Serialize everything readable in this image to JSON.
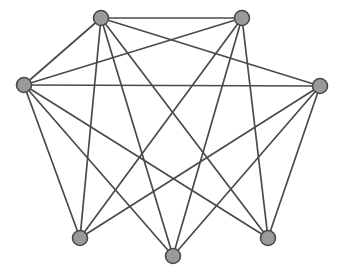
{
  "figure": {
    "background_color": "#ffffff",
    "width": 342,
    "height": 275
  },
  "style": {
    "vertex_fill": "#9a9a9a",
    "vertex_stroke": "#4a4a4a",
    "vertex_stroke_width": 1.6,
    "vertex_radius": 7.5,
    "edge_color": "#4a4a4a",
    "edge_width": 1.7
  },
  "graph": {
    "vertex_count": 7,
    "edge_count": 17,
    "vertices": [
      {
        "id": "v1",
        "label": "top-left",
        "x": 101,
        "y": 18,
        "degree": 5
      },
      {
        "id": "v2",
        "label": "top-right",
        "x": 242,
        "y": 18,
        "degree": 5
      },
      {
        "id": "v3",
        "label": "left",
        "x": 24,
        "y": 85,
        "degree": 6
      },
      {
        "id": "v4",
        "label": "right",
        "x": 320,
        "y": 86,
        "degree": 6
      },
      {
        "id": "v5",
        "label": "bottom-left",
        "x": 80,
        "y": 238,
        "degree": 5
      },
      {
        "id": "v6",
        "label": "bottom-center",
        "x": 173,
        "y": 256,
        "degree": 5
      },
      {
        "id": "v7",
        "label": "bottom-right",
        "x": 268,
        "y": 238,
        "degree": 5
      }
    ],
    "edges": [
      {
        "from": "v1",
        "to": "v2"
      },
      {
        "from": "v1",
        "to": "v4"
      },
      {
        "from": "v1",
        "to": "v5"
      },
      {
        "from": "v1",
        "to": "v6"
      },
      {
        "from": "v1",
        "to": "v7"
      },
      {
        "from": "v2",
        "to": "v3"
      },
      {
        "from": "v2",
        "to": "v5"
      },
      {
        "from": "v2",
        "to": "v6"
      },
      {
        "from": "v2",
        "to": "v7"
      },
      {
        "from": "v3",
        "to": "v4"
      },
      {
        "from": "v3",
        "to": "v5"
      },
      {
        "from": "v3",
        "to": "v6"
      },
      {
        "from": "v3",
        "to": "v7"
      },
      {
        "from": "v4",
        "to": "v5"
      },
      {
        "from": "v4",
        "to": "v6"
      },
      {
        "from": "v4",
        "to": "v7"
      },
      {
        "from": "v3",
        "to": "v1"
      }
    ]
  }
}
